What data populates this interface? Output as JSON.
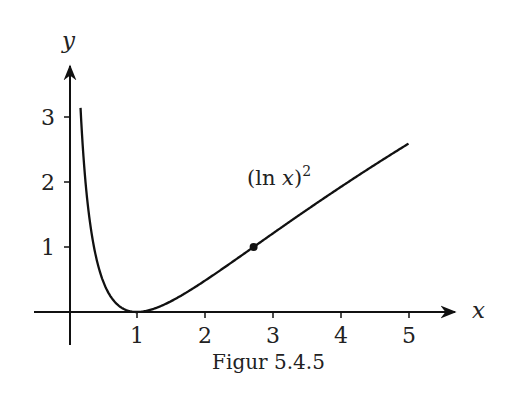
{
  "chart_data": {
    "type": "line",
    "title": "",
    "caption": "Figur 5.4.5",
    "xlabel": "x",
    "ylabel": "y",
    "xlim": [
      -0.5,
      5.7
    ],
    "ylim": [
      -0.5,
      3.8
    ],
    "xticks": [
      1,
      2,
      3,
      4,
      5
    ],
    "yticks": [
      1,
      2,
      3
    ],
    "grid": false,
    "legend": null,
    "series": [
      {
        "name": "(ln x)^2",
        "function": "(ln x)^2",
        "x_range": [
          0.17,
          5
        ],
        "x": [
          0.17,
          0.2,
          0.25,
          0.3,
          0.4,
          0.5,
          0.6,
          0.7,
          0.8,
          0.9,
          1.0,
          1.2,
          1.5,
          2.0,
          2.5,
          2.718,
          3.0,
          3.5,
          4.0,
          4.5,
          5.0
        ],
        "y": [
          3.14,
          2.59,
          1.92,
          1.45,
          0.84,
          0.48,
          0.26,
          0.13,
          0.05,
          0.01,
          0.0,
          0.03,
          0.16,
          0.48,
          0.84,
          1.0,
          1.21,
          1.57,
          1.92,
          2.26,
          2.59
        ]
      }
    ],
    "annotations": [
      {
        "text": "(ln x)²",
        "x": 3.0,
        "y": 2.1
      },
      {
        "type": "point",
        "x": 2.718,
        "y": 1.0,
        "label": "(e, 1)"
      }
    ]
  },
  "labels": {
    "x_axis": "x",
    "y_axis": "y",
    "curve_label_main": "(ln ",
    "curve_label_var": "x",
    "curve_label_close": ")",
    "curve_label_exp": "2",
    "caption": "Figur 5.4.5",
    "xticks": [
      "1",
      "2",
      "3",
      "4",
      "5"
    ],
    "yticks": [
      "1",
      "2",
      "3"
    ]
  }
}
